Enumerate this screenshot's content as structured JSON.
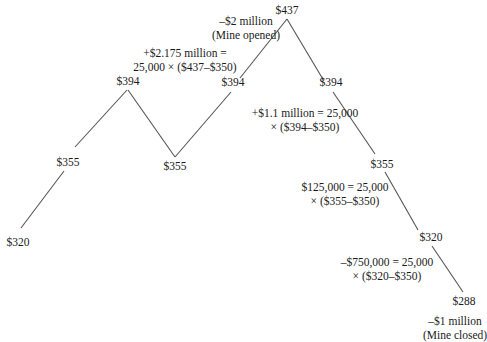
{
  "diagram": {
    "type": "price-path",
    "nodes": [
      {
        "id": "n0",
        "label": "$320",
        "x": 20,
        "y": 230
      },
      {
        "id": "n1",
        "label": "$355",
        "x": 68,
        "y": 165
      },
      {
        "id": "n2",
        "label": "$394",
        "x": 127,
        "y": 89
      },
      {
        "id": "n3",
        "label": "$355",
        "x": 175,
        "y": 157
      },
      {
        "id": "n4",
        "label": "$394",
        "x": 230,
        "y": 91
      },
      {
        "id": "n5",
        "label": "$437",
        "x": 287,
        "y": 18
      },
      {
        "id": "n6",
        "label": "$394",
        "x": 327,
        "y": 91
      },
      {
        "id": "n7",
        "label": "$355",
        "x": 382,
        "y": 165
      },
      {
        "id": "n8",
        "label": "$320",
        "x": 420,
        "y": 238
      },
      {
        "id": "n9",
        "label": "$288",
        "x": 460,
        "y": 300
      }
    ],
    "annotations": [
      {
        "id": "mine-opened",
        "lines": [
          "–$2 million",
          "(Mine opened)"
        ]
      },
      {
        "id": "cf-437",
        "lines": [
          "+$2.175 million =",
          "25,000 × ($437–$350)"
        ]
      },
      {
        "id": "cf-394",
        "lines": [
          "+$1.1 million = 25,000",
          "× ($394–$350)"
        ]
      },
      {
        "id": "cf-355",
        "lines": [
          "$125,000 = 25,000",
          "× ($355–$350)"
        ]
      },
      {
        "id": "cf-320",
        "lines": [
          "–$750,000 = 25,000",
          "× ($320–$350)"
        ]
      },
      {
        "id": "mine-closed",
        "lines": [
          "–$1 million",
          "(Mine closed)"
        ]
      }
    ],
    "colors": {
      "line": "#555555",
      "text": "#1a1a1a",
      "background": "#ffffff"
    }
  }
}
